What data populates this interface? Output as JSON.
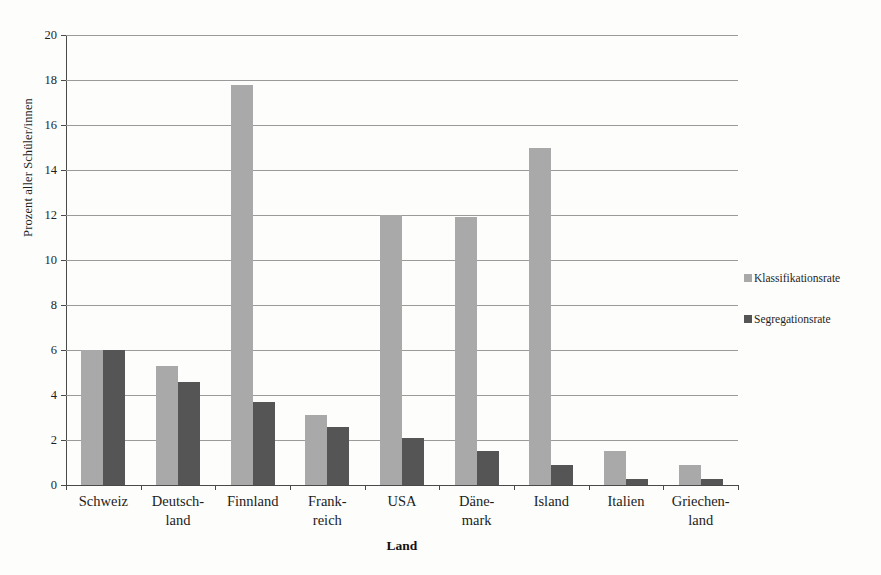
{
  "chart_data": {
    "type": "bar",
    "title": "",
    "xlabel": "Land",
    "ylabel": "Prozent aller Schüler/innen",
    "ylim": [
      0,
      20
    ],
    "ytick_step": 2,
    "yticks": [
      20,
      18,
      16,
      14,
      12,
      10,
      8,
      6,
      4,
      2,
      0
    ],
    "grid": true,
    "legend_position": "right",
    "categories": [
      "Schweiz",
      "Deutsch-land",
      "Finnland",
      "Frank-reich",
      "USA",
      "Däne-mark",
      "Island",
      "Italien",
      "Griechen-land"
    ],
    "category_lines": [
      [
        "Schweiz"
      ],
      [
        "Deutsch-",
        "land"
      ],
      [
        "Finnland"
      ],
      [
        "Frank-",
        "reich"
      ],
      [
        "USA"
      ],
      [
        "Däne-",
        "mark"
      ],
      [
        "Island"
      ],
      [
        "Italien"
      ],
      [
        "Griechen-",
        "land"
      ]
    ],
    "series": [
      {
        "name": "Klassifikationsrate",
        "color": "#a9a9a9",
        "values": [
          6.0,
          5.3,
          17.8,
          3.1,
          12.0,
          11.9,
          15.0,
          1.5,
          0.9
        ]
      },
      {
        "name": "Segregationsrate",
        "color": "#555555",
        "values": [
          6.0,
          4.6,
          3.7,
          2.6,
          2.1,
          1.5,
          0.9,
          0.25,
          0.25
        ]
      }
    ]
  },
  "colors": {
    "background": "#fdfdfb",
    "gridline": "#9a9a9a",
    "axis": "#4a4a4a",
    "text": "#1c1c1c",
    "series_light": "#a9a9a9",
    "series_dark": "#555555"
  }
}
